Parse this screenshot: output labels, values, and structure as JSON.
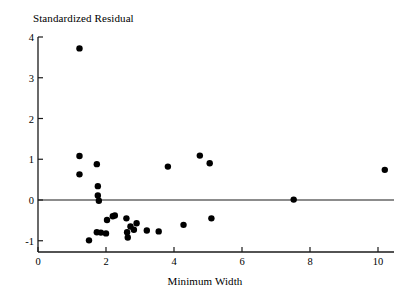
{
  "chart_data": {
    "type": "scatter",
    "title": "",
    "ylabel": "Standardized Residual",
    "xlabel": "Minimum Width",
    "xlim": [
      0,
      10.4
    ],
    "ylim": [
      -1.3,
      4.0
    ],
    "grid": false,
    "legend": null,
    "xticks": [
      0,
      2,
      4,
      6,
      8,
      10
    ],
    "yticks": [
      -1,
      0,
      1,
      2,
      3,
      4
    ],
    "xticklabels": [
      "0",
      "2",
      "4",
      "6",
      "8",
      "10"
    ],
    "yticklabels": [
      "-1",
      "0",
      "1",
      "2",
      "3",
      "4"
    ],
    "reference_line": {
      "axis": "y",
      "value": 0
    },
    "marker": {
      "shape": "circle",
      "color": "#000000",
      "size": 4.2
    },
    "points": [
      {
        "x": 1.22,
        "y": 3.72
      },
      {
        "x": 1.22,
        "y": 1.08
      },
      {
        "x": 1.22,
        "y": 0.63
      },
      {
        "x": 1.73,
        "y": 0.88
      },
      {
        "x": 1.76,
        "y": 0.34
      },
      {
        "x": 1.76,
        "y": 0.11
      },
      {
        "x": 1.79,
        "y": -0.02
      },
      {
        "x": 1.5,
        "y": -0.99
      },
      {
        "x": 1.73,
        "y": -0.79
      },
      {
        "x": 1.85,
        "y": -0.8
      },
      {
        "x": 2.0,
        "y": -0.82
      },
      {
        "x": 2.03,
        "y": -0.49
      },
      {
        "x": 2.2,
        "y": -0.4
      },
      {
        "x": 2.26,
        "y": -0.38
      },
      {
        "x": 2.6,
        "y": -0.45
      },
      {
        "x": 2.62,
        "y": -0.79
      },
      {
        "x": 2.64,
        "y": -0.92
      },
      {
        "x": 2.72,
        "y": -0.65
      },
      {
        "x": 2.82,
        "y": -0.73
      },
      {
        "x": 2.9,
        "y": -0.57
      },
      {
        "x": 3.2,
        "y": -0.75
      },
      {
        "x": 3.55,
        "y": -0.77
      },
      {
        "x": 3.82,
        "y": 0.82
      },
      {
        "x": 4.28,
        "y": -0.61
      },
      {
        "x": 4.76,
        "y": 1.09
      },
      {
        "x": 5.05,
        "y": 0.9
      },
      {
        "x": 5.1,
        "y": -0.45
      },
      {
        "x": 7.52,
        "y": 0.01
      },
      {
        "x": 10.2,
        "y": 0.74
      }
    ]
  }
}
